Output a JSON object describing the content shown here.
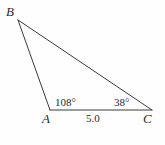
{
  "figure": {
    "type": "triangle-diagram",
    "vertices": {
      "B": "B",
      "A": "A",
      "C": "C"
    },
    "angles": {
      "at_A": "108°",
      "at_C": "38°"
    },
    "sides": {
      "AC": "5.0"
    },
    "colors": {
      "stroke": "#3a3a3a",
      "text": "#2b2b2b",
      "background": "#fefefe"
    },
    "geometry": {
      "B": [
        18,
        20
      ],
      "A": [
        50,
        110
      ],
      "C": [
        152,
        110
      ]
    }
  }
}
